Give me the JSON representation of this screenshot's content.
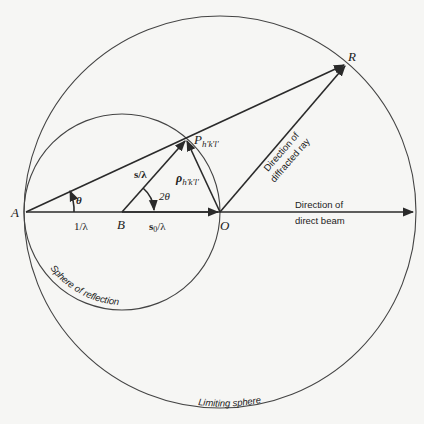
{
  "points": {
    "A": {
      "label": "A",
      "x": 26,
      "y": 212
    },
    "B": {
      "label": "B",
      "x": 122,
      "y": 212
    },
    "O": {
      "label": "O",
      "x": 220,
      "y": 212
    },
    "P": {
      "label": "P",
      "sub": "h'k'l'",
      "x": 186,
      "y": 139
    },
    "R": {
      "label": "R",
      "x": 346,
      "y": 64
    }
  },
  "circles": {
    "limiting": {
      "cx": 220,
      "cy": 212,
      "r": 196,
      "label": "Limiting sphere"
    },
    "reflection": {
      "cx": 122,
      "cy": 212,
      "r": 98,
      "label": "Sphere of reflection"
    }
  },
  "labels": {
    "theta": "θ",
    "two_theta": "2θ",
    "one_over_lambda": "1/λ",
    "s_over_lambda": "s/λ",
    "s0_over_lambda_s": "s",
    "s0_over_lambda_sub": "0",
    "s0_over_lambda_rest": "/λ",
    "rho": "ρ",
    "rho_sub": "h'k'l'",
    "diffracted_line1": "Direction of",
    "diffracted_line2": "diffracted ray",
    "direct_line1": "Direction of",
    "direct_line2": "direct beam"
  },
  "colors": {
    "line": "#2a2a2a",
    "background": "#f6f6f4"
  }
}
